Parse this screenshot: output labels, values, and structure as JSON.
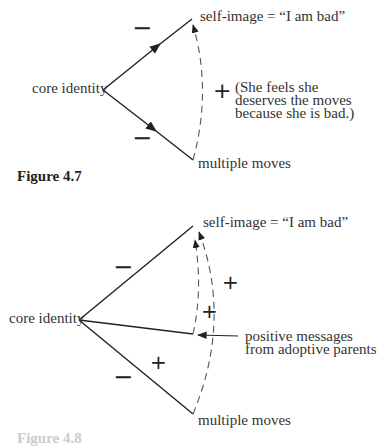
{
  "figure_4_7": {
    "caption": "Figure 4.7",
    "nodes": {
      "core": "core identity",
      "top": "self-image = “I am bad”",
      "bottom": "multiple moves"
    },
    "signs": {
      "upper_link": "−",
      "lower_link": "−",
      "dashed_link": "+"
    },
    "note": [
      "(She feels she",
      "deserves the moves",
      "because she is bad.)"
    ]
  },
  "figure_4_8": {
    "caption": "Figure 4.8",
    "nodes": {
      "core": "core identity",
      "top": "self-image = “I am bad”",
      "bottom": "multiple moves",
      "middle": [
        "positive messages",
        "from adoptive parents"
      ]
    },
    "signs": {
      "upper_link": "−",
      "lower_link": "−",
      "outer_dashed": "+",
      "inner_dashed": "+",
      "lower_region": "+"
    }
  }
}
